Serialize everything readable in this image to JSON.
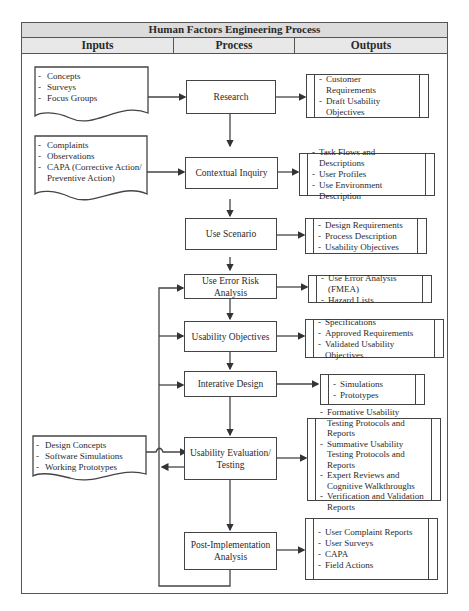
{
  "title": "Human Factors Engineering Process",
  "columns": [
    "Inputs",
    "Process",
    "Outputs"
  ],
  "inputs": [
    {
      "id": "input-1",
      "items": [
        "Concepts",
        "Surveys",
        "Focus Groups"
      ]
    },
    {
      "id": "input-2",
      "items": [
        "Complaints",
        "Observations",
        "CAPA (Corrective Action/",
        "Preventive Action)"
      ]
    },
    {
      "id": "input-3",
      "items": [
        "Design Concepts",
        "Software Simulations",
        "Working Prototypes"
      ]
    }
  ],
  "process": [
    {
      "label": "Research"
    },
    {
      "label": "Contextual Inquiry"
    },
    {
      "label": "Use Scenario"
    },
    {
      "label": "Use Error Risk Analysis"
    },
    {
      "label": "Usability Objectives"
    },
    {
      "label": "Interative Design"
    },
    {
      "label": "Usability Evaluation/ Testing"
    },
    {
      "label": "Post-Implementation Analysis"
    }
  ],
  "outputs": [
    {
      "items": [
        "Customer Requirements",
        "Draft Usability Objectives"
      ]
    },
    {
      "items": [
        "Task Flows and Descriptions",
        "User Profiles",
        "Use Environment Description"
      ]
    },
    {
      "items": [
        "Design Requirements",
        "Process Description",
        "Usability Objectives"
      ]
    },
    {
      "items": [
        "Use Error Analysis (FMEA)",
        "Hazard Lists"
      ]
    },
    {
      "items": [
        "Specifications",
        "Approved Requirements",
        "Validated Usability Objectives"
      ]
    },
    {
      "items": [
        "Simulations",
        "Prototypes"
      ]
    },
    {
      "items": [
        "Formative Usability Testing Protocols and Reports",
        "Summative Usability Testing Protocols and Reports",
        "Expert Reviews and Cognitive Walkthroughs",
        "Verification and Validation Reports"
      ]
    },
    {
      "items": [
        "User Complaint Reports",
        "User Surveys",
        "CAPA",
        "Field Actions"
      ]
    }
  ]
}
